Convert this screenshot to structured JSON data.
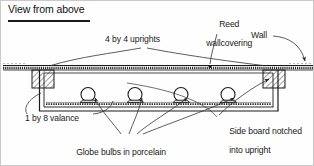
{
  "figure": {
    "title": "View from above",
    "type": "technical-line-drawing",
    "colors": {
      "ink": "#1a1a1a",
      "paper": "#ffffff",
      "hatch": "#4a4a4a",
      "leader": "#333333",
      "border": "#c9c9c9"
    }
  },
  "labels": {
    "uprights": "4 by 4 uprights",
    "reed_wallcovering": "Reed\nwallcovering",
    "reed_line1": "Reed",
    "reed_line2": "wallcovering",
    "wall": "Wall",
    "valance": "1 by 8 valance",
    "globe_bulbs": "Globe bulbs in porcelain\nlampholders",
    "globe_line1": "Globe bulbs in porcelain",
    "globe_line2": "lampholders",
    "side_board": "Side board notched\ninto upright",
    "side_board_line1": "Side board notched",
    "side_board_line2": "into upright"
  },
  "drawing": {
    "bulb_count": 4,
    "bulb_positions_x": [
      87,
      134,
      180,
      227
    ],
    "bulb_baseline_y": 101,
    "bulb_radius": 7.0,
    "upright_left": {
      "x": 31,
      "y": 66,
      "w": 22,
      "h": 19
    },
    "upright_right": {
      "x": 262,
      "y": 66,
      "w": 22,
      "h": 19
    },
    "wall_line_y": 67,
    "valance_front_y": 103,
    "box_left_x": 38,
    "box_right_x": 277
  }
}
